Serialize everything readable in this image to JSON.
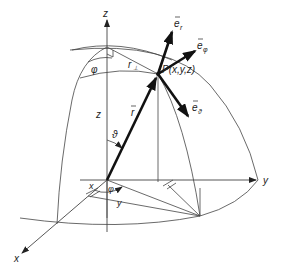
{
  "diagram": {
    "axes": {
      "x_label": "x",
      "y_label": "y",
      "z_label": "z"
    },
    "point_label": "P(x,y,z)",
    "vectors": {
      "e_r": "e",
      "e_r_sub": "r",
      "e_phi": "e",
      "e_phi_sub": "φ",
      "e_theta": "e",
      "e_theta_sub": "ϑ",
      "r_vec": "r"
    },
    "labels": {
      "phi_top": "φ",
      "r_perp": "r",
      "r_perp_sub": "⊥",
      "z_height": "z",
      "theta": "ϑ",
      "phi_bottom": "φ",
      "x_coord": "x",
      "y_coord": "y"
    },
    "colors": {
      "line": "#444444",
      "vector": "#111111",
      "background": "#ffffff"
    }
  }
}
